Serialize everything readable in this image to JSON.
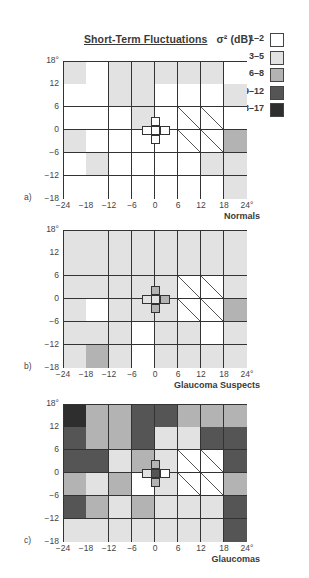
{
  "title": {
    "text": "Short-Term Fluctuations",
    "symbol": "σ² (dB)"
  },
  "legend": [
    {
      "label": "1–2",
      "level": 1,
      "color": "#ffffff"
    },
    {
      "label": "3–5",
      "level": 2,
      "color": "#e2e2e2"
    },
    {
      "label": "6–8",
      "level": 3,
      "color": "#b3b3b3"
    },
    {
      "label": "9–12",
      "level": 4,
      "color": "#555555"
    },
    {
      "label": "13–17",
      "level": 5,
      "color": "#2e2e2e"
    }
  ],
  "axes": {
    "y_ticks": [
      "18°",
      "12",
      "6",
      "0",
      "−6",
      "−12",
      "−18"
    ],
    "x_ticks": [
      "−24",
      "−18",
      "−12",
      "−6",
      "0",
      "6",
      "12",
      "18",
      "24°"
    ]
  },
  "chart_data": [
    {
      "type": "heatmap",
      "panel": "a)",
      "title": "Normals",
      "xlabel": "degrees",
      "ylabel": "degrees",
      "x_range": [
        -24,
        24
      ],
      "y_range": [
        -18,
        18
      ],
      "legend_position": "top-right",
      "note": "rows top (12..18) to bottom (-18..-12); levels 1=1–2, 2=3–5, 3=6–8, 4=9–12, 5=13–17, H=hatched blind-spot region",
      "cells": [
        [
          2,
          1,
          2,
          2,
          2,
          2,
          2,
          1
        ],
        [
          1,
          1,
          2,
          2,
          1,
          1,
          1,
          2
        ],
        [
          1,
          1,
          1,
          2,
          1,
          "H",
          "H",
          1
        ],
        [
          2,
          1,
          1,
          1,
          1,
          "H",
          "H",
          3
        ],
        [
          1,
          2,
          1,
          1,
          1,
          1,
          2,
          2
        ],
        [
          1,
          1,
          1,
          1,
          1,
          1,
          1,
          2
        ]
      ],
      "center_cross": {
        "top": 1,
        "left": 1,
        "center": 1,
        "right": 1,
        "bottom": 1
      }
    },
    {
      "type": "heatmap",
      "panel": "b)",
      "title": "Glaucoma Suspects",
      "xlabel": "degrees",
      "ylabel": "degrees",
      "x_range": [
        -24,
        24
      ],
      "y_range": [
        -18,
        18
      ],
      "cells": [
        [
          2,
          2,
          2,
          2,
          2,
          2,
          2,
          2
        ],
        [
          2,
          2,
          2,
          2,
          2,
          2,
          2,
          2
        ],
        [
          2,
          2,
          2,
          2,
          2,
          "H",
          "H",
          2
        ],
        [
          2,
          1,
          2,
          2,
          2,
          "H",
          "H",
          3
        ],
        [
          2,
          2,
          2,
          1,
          2,
          2,
          1,
          2
        ],
        [
          2,
          3,
          2,
          1,
          2,
          2,
          2,
          2
        ]
      ],
      "center_cross": {
        "top": 3,
        "left": 2,
        "center": 2,
        "right": 3,
        "bottom": 3
      }
    },
    {
      "type": "heatmap",
      "panel": "c)",
      "title": "Glaucomas",
      "xlabel": "degrees",
      "ylabel": "degrees",
      "x_range": [
        -24,
        24
      ],
      "y_range": [
        -18,
        18
      ],
      "cells": [
        [
          5,
          3,
          3,
          4,
          4,
          3,
          3,
          3
        ],
        [
          4,
          3,
          3,
          4,
          2,
          2,
          4,
          4
        ],
        [
          4,
          4,
          2,
          3,
          2,
          "H",
          "H",
          4
        ],
        [
          3,
          2,
          3,
          1,
          2,
          "H",
          "H",
          3
        ],
        [
          4,
          3,
          2,
          3,
          2,
          2,
          2,
          4
        ],
        [
          2,
          2,
          2,
          2,
          2,
          2,
          2,
          4
        ]
      ],
      "center_cross": {
        "top": 3,
        "left": 2,
        "center": 4,
        "right": 1,
        "bottom": 3
      }
    }
  ]
}
